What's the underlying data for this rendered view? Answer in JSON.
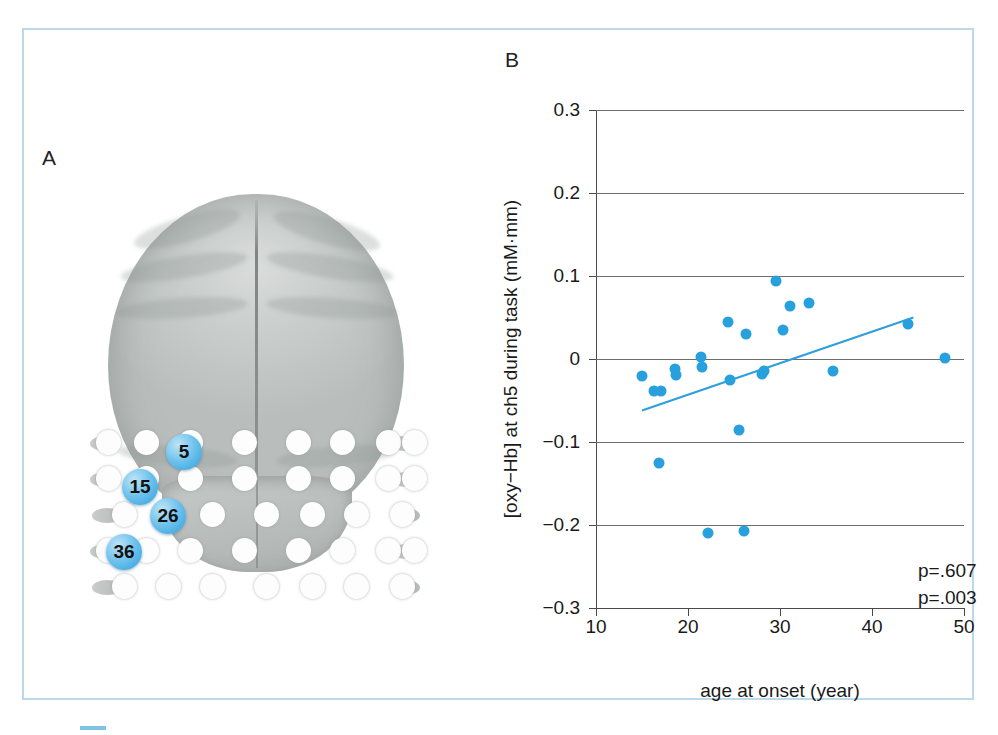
{
  "figure": {
    "panel_a_letter": "A",
    "panel_b_letter": "B"
  },
  "panel_a": {
    "description": "head-model-optode-layout",
    "highlighted_channels": [
      {
        "label": "5",
        "x": 228,
        "y": 300
      },
      {
        "label": "15",
        "x": 184,
        "y": 335
      },
      {
        "label": "26",
        "x": 212,
        "y": 364
      },
      {
        "label": "36",
        "x": 168,
        "y": 400
      }
    ]
  },
  "caption": {
    "marker": "",
    "text": ""
  },
  "chart_data": {
    "type": "scatter",
    "title": "",
    "xlabel": "age at onset (year)",
    "ylabel": "[oxy−Hb] at ch5 during task (mM·mm)",
    "xlim": [
      10,
      50
    ],
    "ylim": [
      -0.3,
      0.3
    ],
    "xticks": [
      10,
      20,
      30,
      40,
      50
    ],
    "yticks": [
      0.3,
      0.2,
      0.1,
      0,
      -0.1,
      -0.2,
      -0.3
    ],
    "ytick_labels": [
      "0.3",
      "0.2",
      "0.1",
      "0",
      "−0.1",
      "−0.2",
      "−0.3"
    ],
    "xtick_labels": [
      "10",
      "20",
      "30",
      "40",
      "50"
    ],
    "grid": "horizontal",
    "legend": "none",
    "point_color": "#29a0de",
    "line_color": "#2f9fdb",
    "points": [
      {
        "x": 15.0,
        "y": -0.02
      },
      {
        "x": 16.3,
        "y": -0.039
      },
      {
        "x": 17.1,
        "y": -0.038
      },
      {
        "x": 16.8,
        "y": -0.125
      },
      {
        "x": 18.6,
        "y": -0.012
      },
      {
        "x": 18.7,
        "y": -0.019
      },
      {
        "x": 21.4,
        "y": 0.003
      },
      {
        "x": 21.5,
        "y": -0.01
      },
      {
        "x": 22.2,
        "y": -0.21
      },
      {
        "x": 24.3,
        "y": 0.045
      },
      {
        "x": 24.6,
        "y": -0.025
      },
      {
        "x": 25.5,
        "y": -0.085
      },
      {
        "x": 26.3,
        "y": 0.03
      },
      {
        "x": 26.1,
        "y": -0.207
      },
      {
        "x": 28.0,
        "y": -0.018
      },
      {
        "x": 28.3,
        "y": -0.014
      },
      {
        "x": 29.6,
        "y": 0.094
      },
      {
        "x": 30.3,
        "y": 0.035
      },
      {
        "x": 31.1,
        "y": 0.064
      },
      {
        "x": 33.2,
        "y": 0.068
      },
      {
        "x": 35.8,
        "y": -0.014
      },
      {
        "x": 43.9,
        "y": 0.042
      },
      {
        "x": 47.9,
        "y": 0.001
      }
    ],
    "regression_line": {
      "x1": 15.0,
      "y1": -0.062,
      "x2": 44.5,
      "y2": 0.05
    },
    "annotations": [
      "p=.607",
      "p=.003"
    ]
  }
}
